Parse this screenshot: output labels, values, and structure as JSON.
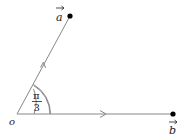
{
  "diagram": {
    "origin_label": "o",
    "vector_a_label": "a",
    "vector_b_label": "b",
    "angle_numerator": "π",
    "angle_denominator": "3",
    "angle_value": "π/3",
    "colors": {
      "line": "#888888",
      "point": "#000000",
      "text": "#222222"
    }
  }
}
